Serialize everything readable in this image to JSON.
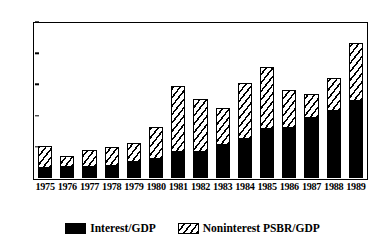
{
  "chart_data": {
    "type": "bar",
    "subtype": "stacked",
    "title": "",
    "xlabel": "",
    "ylabel": "",
    "categories": [
      "1975",
      "1976",
      "1977",
      "1978",
      "1979",
      "1980",
      "1981",
      "1982",
      "1983",
      "1984",
      "1985",
      "1986",
      "1987",
      "1988",
      "1989"
    ],
    "series": [
      {
        "name": "Interest/GDP",
        "fill": "solid-black",
        "color": "#000000",
        "values": [
          1.8,
          2.0,
          2.0,
          2.1,
          2.8,
          3.2,
          4.3,
          4.3,
          5.5,
          6.5,
          8.0,
          8.3,
          9.8,
          10.9,
          12.6
        ]
      },
      {
        "name": "Noninterest PSBR/GDP",
        "fill": "diagonal-hatch",
        "color": "#ffffff",
        "values": [
          3.3,
          1.6,
          2.5,
          2.8,
          2.8,
          5.0,
          10.4,
          8.3,
          5.8,
          8.8,
          9.8,
          5.8,
          3.7,
          5.2,
          9.0
        ]
      }
    ],
    "totals": [
      5.1,
      3.6,
      4.5,
      4.9,
      5.6,
      8.2,
      14.7,
      12.6,
      11.3,
      15.3,
      17.8,
      14.1,
      13.5,
      16.1,
      21.6
    ],
    "yticks": [
      0,
      5,
      10,
      15,
      20,
      25
    ],
    "ytick_labels": [
      "0",
      "5",
      "10",
      "15",
      "20",
      "25"
    ],
    "ylim": [
      0,
      25
    ],
    "grid": false,
    "legend_position": "bottom-center",
    "legend": [
      {
        "label": "Interest/GDP",
        "swatch": "solid-black"
      },
      {
        "label": "Noninterest  PSBR/GDP",
        "swatch": "diagonal-hatch"
      }
    ]
  }
}
